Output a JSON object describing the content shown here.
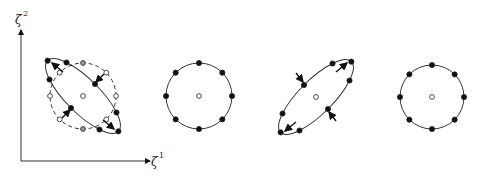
{
  "axes": {
    "x_label": "ζ",
    "x_label_sup": "1",
    "y_label": "ζ",
    "y_label_sup": "2"
  },
  "colors": {
    "stroke": "#333333",
    "filled_point": "#111111",
    "open_point": "#ffffff",
    "grey_point": "#999999"
  },
  "panels": [
    {
      "id": "panel-1",
      "description": "initial circle (dashed) deformed into ellipse with displacement arrows",
      "shape": "ellipse-nw-se",
      "has_dashed_reference_circle": true,
      "points_on_curve": 8
    },
    {
      "id": "panel-2",
      "description": "circle of eight material points",
      "shape": "circle",
      "points_on_curve": 8
    },
    {
      "id": "panel-3",
      "description": "ellipse oriented SW-NE with compressive/tensile arrows",
      "shape": "ellipse-sw-ne",
      "points_on_curve": 8
    },
    {
      "id": "panel-4",
      "description": "circle of eight material points",
      "shape": "circle",
      "points_on_curve": 8
    }
  ]
}
